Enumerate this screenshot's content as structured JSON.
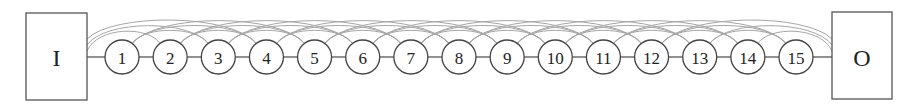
{
  "diagram": {
    "input_label": "I",
    "output_label": "O",
    "nodes": [
      {
        "label": "1"
      },
      {
        "label": "2"
      },
      {
        "label": "3"
      },
      {
        "label": "4"
      },
      {
        "label": "5"
      },
      {
        "label": "6"
      },
      {
        "label": "7"
      },
      {
        "label": "8"
      },
      {
        "label": "9"
      },
      {
        "label": "10"
      },
      {
        "label": "11"
      },
      {
        "label": "12"
      },
      {
        "label": "13"
      },
      {
        "label": "14"
      },
      {
        "label": "15"
      }
    ],
    "colors": {
      "node_stroke": "#444444",
      "arc_stroke": "#a6a6a6",
      "text": "#222222"
    }
  }
}
